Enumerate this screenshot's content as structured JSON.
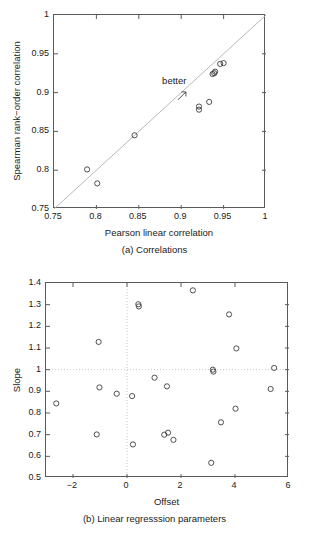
{
  "figure": {
    "panels": [
      {
        "id": "a",
        "caption": "(a) Correlations",
        "xlabel": "Pearson linear correlation",
        "ylabel": "Spearman rank−order correlation",
        "annotation": "better"
      },
      {
        "id": "b",
        "caption": "(b) Linear regresssion parameters",
        "xlabel": "Offset",
        "ylabel": "Slope"
      }
    ]
  },
  "chart_data": [
    {
      "type": "scatter",
      "title": "(a) Correlations",
      "xlabel": "Pearson linear correlation",
      "ylabel": "Spearman rank−order correlation",
      "xlim": [
        0.75,
        1.0
      ],
      "ylim": [
        0.75,
        1.0
      ],
      "xticks": [
        0.75,
        0.8,
        0.85,
        0.9,
        0.95,
        1
      ],
      "xticklabels": [
        "0.75",
        "0.8",
        "0.85",
        "0.9",
        "0.95",
        "1"
      ],
      "yticks": [
        0.75,
        0.8,
        0.85,
        0.9,
        0.95,
        1
      ],
      "yticklabels": [
        "0.75",
        "0.8",
        "0.85",
        "0.9",
        "0.95",
        "1"
      ],
      "grid": false,
      "marker": "open-circle",
      "reference_line": {
        "type": "identity",
        "from": [
          0.75,
          0.75
        ],
        "to": [
          1.0,
          1.0
        ],
        "style": "solid"
      },
      "annotations": [
        {
          "text": "better",
          "x": 0.893,
          "y": 0.907,
          "arrow_to": [
            0.902,
            0.897
          ]
        }
      ],
      "points": [
        {
          "x": 0.789,
          "y": 0.801
        },
        {
          "x": 0.801,
          "y": 0.783
        },
        {
          "x": 0.845,
          "y": 0.845
        },
        {
          "x": 0.921,
          "y": 0.882
        },
        {
          "x": 0.921,
          "y": 0.878
        },
        {
          "x": 0.933,
          "y": 0.888
        },
        {
          "x": 0.937,
          "y": 0.924
        },
        {
          "x": 0.939,
          "y": 0.925
        },
        {
          "x": 0.94,
          "y": 0.927
        },
        {
          "x": 0.946,
          "y": 0.937
        },
        {
          "x": 0.95,
          "y": 0.938
        }
      ]
    },
    {
      "type": "scatter",
      "title": "(b) Linear regresssion parameters",
      "xlabel": "Offset",
      "ylabel": "Slope",
      "xlim": [
        -3,
        6
      ],
      "ylim": [
        0.5,
        1.4
      ],
      "xticks": [
        -2,
        0,
        2,
        4,
        6
      ],
      "xticklabels": [
        "−2",
        "0",
        "2",
        "4",
        "6"
      ],
      "yticks": [
        0.5,
        0.6,
        0.7,
        0.8,
        0.9,
        1.0,
        1.1,
        1.2,
        1.3,
        1.4
      ],
      "yticklabels": [
        "0.5",
        "0.6",
        "0.7",
        "0.8",
        "0.9",
        "1",
        "1.1",
        "1.2",
        "1.3",
        "1.4"
      ],
      "grid": false,
      "marker": "open-circle",
      "reference_lines": [
        {
          "type": "horizontal",
          "y": 1.0,
          "style": "dotted"
        },
        {
          "type": "vertical",
          "x": 0.0,
          "style": "dotted"
        }
      ],
      "points": [
        {
          "x": -2.62,
          "y": 0.844
        },
        {
          "x": -1.05,
          "y": 1.128
        },
        {
          "x": -1.02,
          "y": 0.918
        },
        {
          "x": -1.12,
          "y": 0.701
        },
        {
          "x": -0.38,
          "y": 0.889
        },
        {
          "x": 0.19,
          "y": 0.878
        },
        {
          "x": 0.22,
          "y": 0.655
        },
        {
          "x": 0.42,
          "y": 1.302
        },
        {
          "x": 0.44,
          "y": 1.292
        },
        {
          "x": 1.02,
          "y": 0.963
        },
        {
          "x": 1.38,
          "y": 0.7
        },
        {
          "x": 1.52,
          "y": 0.709
        },
        {
          "x": 1.48,
          "y": 0.923
        },
        {
          "x": 1.72,
          "y": 0.676
        },
        {
          "x": 2.44,
          "y": 1.366
        },
        {
          "x": 3.18,
          "y": 1.0
        },
        {
          "x": 3.2,
          "y": 0.991
        },
        {
          "x": 3.12,
          "y": 0.57
        },
        {
          "x": 3.48,
          "y": 0.757
        },
        {
          "x": 3.78,
          "y": 1.255
        },
        {
          "x": 4.02,
          "y": 0.82
        },
        {
          "x": 4.05,
          "y": 1.098
        },
        {
          "x": 5.32,
          "y": 0.911
        },
        {
          "x": 5.45,
          "y": 1.008
        }
      ]
    }
  ]
}
